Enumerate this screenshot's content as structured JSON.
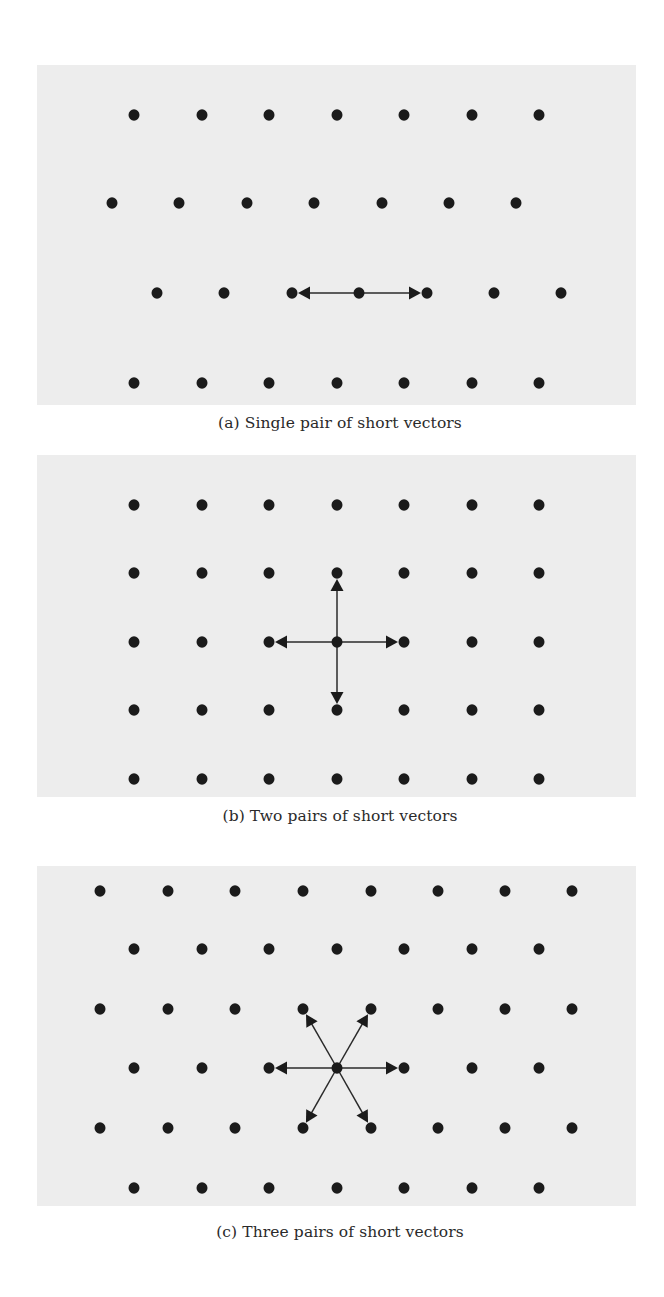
{
  "figure": {
    "background_color": "#ededed",
    "dot_color": "#1b1b1b",
    "arrow_color": "#2a2a2a",
    "dot_radius": 5.5,
    "panels": [
      {
        "id": "a",
        "caption": "(a) Single pair of short vectors",
        "box": {
          "x": 37,
          "y": 65,
          "w": 599,
          "h": 340
        },
        "caption_y": 424,
        "lattice_rows": [
          {
            "y": 115,
            "xs": [
              134,
              202,
              269,
              337,
              404,
              472,
              539
            ]
          },
          {
            "y": 203,
            "xs": [
              112,
              179,
              247,
              314,
              382,
              449,
              516
            ]
          },
          {
            "y": 293,
            "xs": [
              157,
              224,
              292,
              359,
              427,
              494,
              561
            ]
          },
          {
            "y": 383,
            "xs": [
              134,
              202,
              269,
              337,
              404,
              472,
              539
            ]
          }
        ],
        "center": {
          "x": 359,
          "y": 293
        },
        "vectors": [
          {
            "to": {
              "x": 292,
              "y": 293
            }
          },
          {
            "to": {
              "x": 427,
              "y": 293
            }
          }
        ]
      },
      {
        "id": "b",
        "caption": "(b) Two pairs of short vectors",
        "box": {
          "x": 37,
          "y": 455,
          "w": 599,
          "h": 342
        },
        "caption_y": 817,
        "lattice_rows": [
          {
            "y": 505,
            "xs": [
              134,
              202,
              269,
              337,
              404,
              472,
              539
            ]
          },
          {
            "y": 573,
            "xs": [
              134,
              202,
              269,
              337,
              404,
              472,
              539
            ]
          },
          {
            "y": 642,
            "xs": [
              134,
              202,
              269,
              337,
              404,
              472,
              539
            ]
          },
          {
            "y": 710,
            "xs": [
              134,
              202,
              269,
              337,
              404,
              472,
              539
            ]
          },
          {
            "y": 779,
            "xs": [
              134,
              202,
              269,
              337,
              404,
              472,
              539
            ]
          }
        ],
        "center": {
          "x": 337,
          "y": 642
        },
        "vectors": [
          {
            "to": {
              "x": 269,
              "y": 642
            }
          },
          {
            "to": {
              "x": 404,
              "y": 642
            }
          },
          {
            "to": {
              "x": 337,
              "y": 573
            }
          },
          {
            "to": {
              "x": 337,
              "y": 710
            }
          }
        ]
      },
      {
        "id": "c",
        "caption": "(c) Three pairs of short vectors",
        "box": {
          "x": 37,
          "y": 866,
          "w": 599,
          "h": 340
        },
        "caption_y": 1233,
        "lattice_rows": [
          {
            "y": 891,
            "xs": [
              100,
              168,
              235,
              303,
              371,
              438,
              505,
              572
            ]
          },
          {
            "y": 949,
            "xs": [
              134,
              202,
              269,
              337,
              404,
              472,
              539
            ]
          },
          {
            "y": 1009,
            "xs": [
              100,
              168,
              235,
              303,
              371,
              438,
              505,
              572
            ]
          },
          {
            "y": 1068,
            "xs": [
              134,
              202,
              269,
              337,
              404,
              472,
              539
            ]
          },
          {
            "y": 1128,
            "xs": [
              100,
              168,
              235,
              303,
              371,
              438,
              505,
              572
            ]
          },
          {
            "y": 1188,
            "xs": [
              134,
              202,
              269,
              337,
              404,
              472,
              539
            ]
          }
        ],
        "center": {
          "x": 337,
          "y": 1068
        },
        "vectors": [
          {
            "to": {
              "x": 269,
              "y": 1068
            }
          },
          {
            "to": {
              "x": 404,
              "y": 1068
            }
          },
          {
            "to": {
              "x": 303,
              "y": 1009
            }
          },
          {
            "to": {
              "x": 371,
              "y": 1009
            }
          },
          {
            "to": {
              "x": 303,
              "y": 1128
            }
          },
          {
            "to": {
              "x": 371,
              "y": 1128
            }
          }
        ]
      }
    ]
  }
}
